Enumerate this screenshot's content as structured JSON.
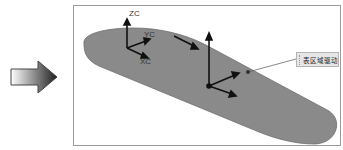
{
  "arrow": {
    "icon": "right-arrow-icon",
    "gradient_start": "#ffffff",
    "gradient_end": "#222222"
  },
  "viewport": {
    "surface_color": "#8a8a8a",
    "work_csys": {
      "labels": {
        "z": "ZC",
        "y": "YC",
        "x": "XC"
      }
    },
    "callout": {
      "label": "表区域驱动"
    }
  }
}
